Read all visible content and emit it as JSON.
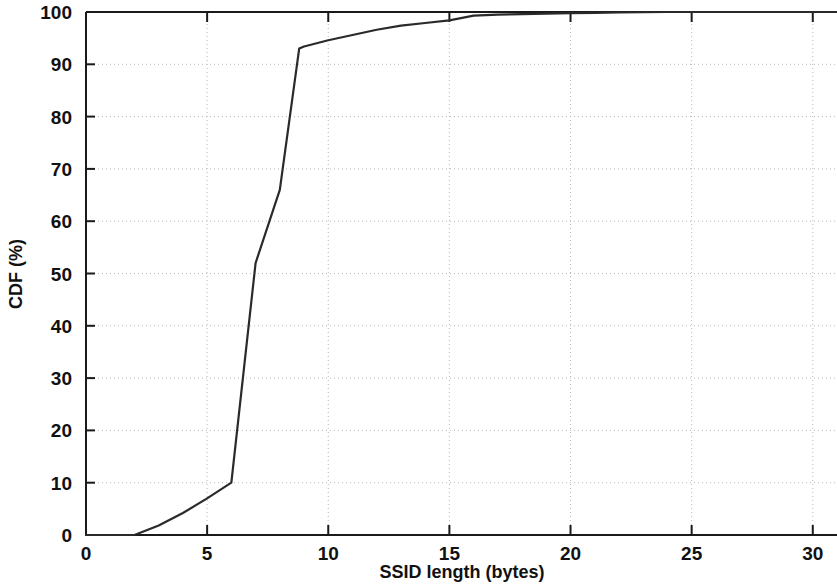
{
  "chart_data": {
    "type": "line",
    "title": "",
    "subtitle": "",
    "xlabel": "SSID length (bytes)",
    "ylabel": "CDF (%)",
    "xlim": [
      0,
      31.0
    ],
    "ylim": [
      0,
      100
    ],
    "xticks": [
      0,
      5,
      10,
      15,
      20,
      25,
      30
    ],
    "xtick_labels": [
      "0",
      "5",
      "10",
      "15",
      "20",
      "25",
      "30"
    ],
    "yticks": [
      0,
      10,
      20,
      30,
      40,
      50,
      60,
      70,
      80,
      90,
      100
    ],
    "ytick_labels": [
      "0",
      "10",
      "20",
      "30",
      "40",
      "50",
      "60",
      "70",
      "80",
      "90",
      "100"
    ],
    "grid": true,
    "grid_style": "dotted",
    "legend": null,
    "legend_position": "none",
    "line_color": "#2a2a2a",
    "series": [
      {
        "name": "CDF of SSID length",
        "x": [
          0,
          1,
          2,
          3,
          4,
          5,
          6,
          7,
          8,
          8.8,
          9,
          10,
          11,
          12,
          13,
          14,
          15,
          16,
          17,
          18,
          19,
          20,
          21,
          22,
          23,
          24,
          25,
          26,
          27,
          28,
          29,
          30,
          31
        ],
        "y": [
          0,
          0,
          0,
          1.8,
          4.2,
          7.0,
          10.0,
          52.0,
          66.0,
          93.0,
          93.4,
          94.6,
          95.6,
          96.6,
          97.4,
          97.9,
          98.4,
          99.3,
          99.5,
          99.6,
          99.7,
          99.8,
          99.85,
          99.9,
          99.95,
          100,
          100,
          100,
          100,
          100,
          100,
          100,
          100
        ]
      }
    ],
    "annotations": []
  },
  "axis": {
    "x_title": "SSID length (bytes)",
    "y_title": "CDF (%)"
  }
}
